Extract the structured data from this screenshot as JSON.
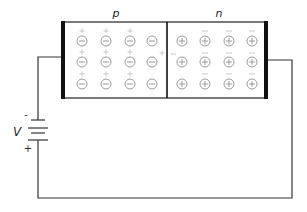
{
  "diagram": {
    "regions": [
      {
        "id": "p",
        "label": "p",
        "fixed_ion_sign": "-",
        "mobile_carrier_sign": "+"
      },
      {
        "id": "n",
        "label": "n",
        "fixed_ion_sign": "+",
        "mobile_carrier_sign": "-"
      }
    ],
    "grid": {
      "rows": 3,
      "cols_per_region": 4
    },
    "battery": {
      "label": "V",
      "top_terminal": "-",
      "bottom_terminal": "+"
    },
    "colors": {
      "wire": "#333333",
      "electrode": "#111111",
      "ion": "#9a9a9a",
      "carrier": "#c4c4c4"
    }
  }
}
